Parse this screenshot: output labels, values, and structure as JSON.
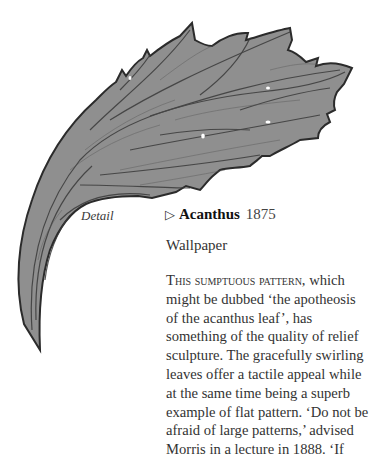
{
  "illustration": {
    "subject": "acanthus-leaf-detail",
    "fill_color": "#8f8f8f",
    "outline_color": "#2b2b2b"
  },
  "caption": "Detail",
  "entry": {
    "marker": "▷",
    "name": "Acanthus",
    "year": "1875",
    "type": "Wallpaper"
  },
  "body": {
    "lead_small_caps": "This sumptuous pattern,",
    "lines": [
      " which",
      "might be dubbed ‘the apotheosis",
      "of the acanthus leaf’, has",
      "something of the quality of relief",
      "sculpture. The gracefully swirling",
      "leaves offer a tactile appeal while",
      "at the same time being a superb",
      "example of flat pattern. ‘Do not be",
      "afraid of large patterns,’ advised",
      "Morris in a lecture in 1888. ‘If"
    ]
  }
}
